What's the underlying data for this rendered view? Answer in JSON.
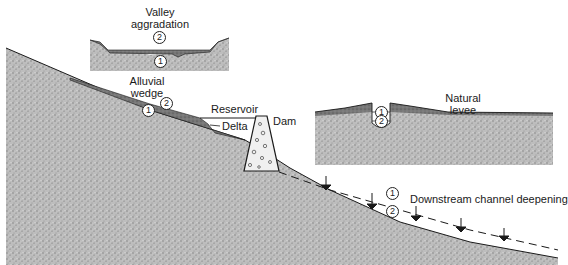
{
  "diagram": {
    "colors": {
      "ground": "#b8b8b8",
      "ground_dark": "#8a8a8a",
      "sediment": "#6f6f6f",
      "dam_fill": "#efefef",
      "line": "#1a1a1a"
    },
    "labels": {
      "valley_aggradation_line1": "Valley",
      "valley_aggradation_line2": "aggradation",
      "alluvial_wedge_line1": "Alluvial",
      "alluvial_wedge_line2": "wedge",
      "reservoir": "Reservoir",
      "delta": "Delta",
      "dam": "Dam",
      "natural_levee_line1": "Natural",
      "natural_levee_line2": "levee",
      "downstream": "Downstream channel deepening"
    },
    "markers": {
      "valley_top": "2",
      "valley_bottom": "1",
      "wedge_before": "1",
      "wedge_after": "2",
      "levee_before": "1",
      "levee_after": "2",
      "downstream_before": "1",
      "downstream_after": "2"
    }
  }
}
